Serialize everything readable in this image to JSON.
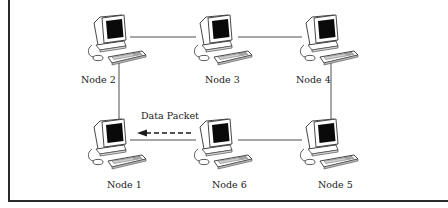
{
  "diagram": {
    "type": "ring-network",
    "nodes": [
      {
        "id": "node1",
        "label": "Node 1"
      },
      {
        "id": "node2",
        "label": "Node 2"
      },
      {
        "id": "node3",
        "label": "Node 3"
      },
      {
        "id": "node4",
        "label": "Node 4"
      },
      {
        "id": "node5",
        "label": "Node 5"
      },
      {
        "id": "node6",
        "label": "Node 6"
      }
    ],
    "connections": [
      [
        "Node 2",
        "Node 3"
      ],
      [
        "Node 3",
        "Node 4"
      ],
      [
        "Node 4",
        "Node 5"
      ],
      [
        "Node 5",
        "Node 6"
      ],
      [
        "Node 6",
        "Node 1"
      ],
      [
        "Node 1",
        "Node 2"
      ]
    ],
    "packet": {
      "label": "Data Packet",
      "from": "Node 6",
      "to": "Node 1",
      "style": "dashed-arrow"
    },
    "icon": "desktop-computer-icon",
    "colors": {
      "line": "#3a3a3a",
      "screen": "#0a0a0a",
      "background": "#ffffff"
    }
  }
}
